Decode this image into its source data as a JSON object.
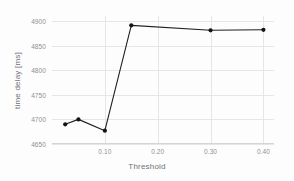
{
  "chart_data": {
    "type": "line",
    "title": "",
    "subtitle": "",
    "xlabel": "Threshold",
    "ylabel": "time delay [ms]",
    "x": [
      0.025,
      0.05,
      0.1,
      0.15,
      0.3,
      0.4
    ],
    "values": [
      4690,
      4700,
      4677,
      4891,
      4881,
      4882
    ],
    "series": [
      {
        "name": "time delay",
        "x": [
          0.025,
          0.05,
          0.1,
          0.15,
          0.3,
          0.4
        ],
        "values": [
          4690,
          4700,
          4677,
          4891,
          4881,
          4882
        ]
      }
    ],
    "xlim": [
      0.0,
      0.42
    ],
    "ylim": [
      4650,
      4910
    ],
    "xticks": [
      0.1,
      0.2,
      0.3,
      0.4
    ],
    "xticklabels": [
      "0.10",
      "0.20",
      "0.30",
      "0.40"
    ],
    "yticks": [
      4650,
      4700,
      4750,
      4800,
      4850,
      4900
    ],
    "yticklabels": [
      "4650",
      "4700",
      "4750",
      "4800",
      "4850",
      "4900"
    ],
    "grid": true,
    "legend": null,
    "legend_position": "none",
    "marker": "circle",
    "line_color": "#202020",
    "marker_color": "#141414",
    "grid_color": "#e4e6e8",
    "tick_label_color": "#8d9094",
    "axis_label_color": "#6f7276",
    "background_color": "#fdfdfd"
  }
}
